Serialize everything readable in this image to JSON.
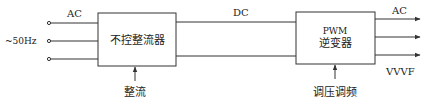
{
  "diagram": {
    "input": {
      "label_type": "AC",
      "label_freq": "~50Hz"
    },
    "rectifier": {
      "label": "不控整流器",
      "control_label": "整流"
    },
    "dc_link": {
      "label": "DC"
    },
    "inverter": {
      "label_line1": "PWM",
      "label_line2": "逆变器",
      "control_label": "调压调频"
    },
    "output": {
      "label_type": "AC",
      "label_mode": "VVVF"
    },
    "colors": {
      "line": "#333333",
      "text": "#222222",
      "background": "#ffffff"
    }
  }
}
